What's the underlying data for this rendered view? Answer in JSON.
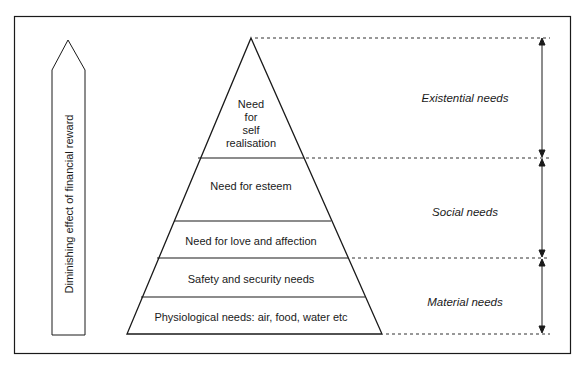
{
  "diagram": {
    "left_arrow": {
      "label": "Diminishing effect of financial reward",
      "direction": "up"
    },
    "pyramid": {
      "levels": [
        {
          "label_lines": [
            "Need",
            "for",
            "self",
            "realisation"
          ],
          "label": "Need for self realisation"
        },
        {
          "label": "Need for esteem"
        },
        {
          "label": "Need for love and affection"
        },
        {
          "label": "Safety and security needs"
        },
        {
          "label": "Physiological needs: air, food, water etc"
        }
      ]
    },
    "categories": [
      {
        "label": "Existential needs",
        "spans": [
          "Need for self realisation"
        ]
      },
      {
        "label": "Social needs",
        "spans": [
          "Need for esteem",
          "Need for love and affection"
        ]
      },
      {
        "label": "Material needs",
        "spans": [
          "Safety and security needs",
          "Physiological needs: air, food, water etc"
        ]
      }
    ],
    "colors": {
      "line": "#1a1a1a",
      "background": "#ffffff"
    }
  }
}
